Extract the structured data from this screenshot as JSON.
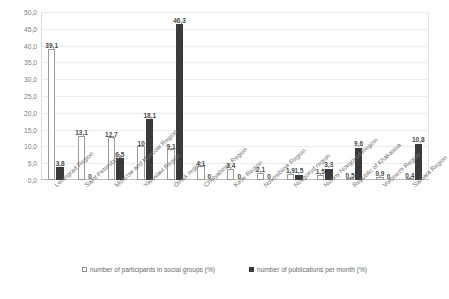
{
  "chart_data": {
    "type": "bar",
    "title": "",
    "subtitle": "",
    "xlabel": "",
    "ylabel": "",
    "ylim": [
      0,
      50
    ],
    "ytick_step": 5,
    "grid": true,
    "decimal_separator": ",",
    "legend_position": "bottom",
    "orientation": "vertical",
    "categories": [
      "Leningrad Region",
      "Saint Petersburg",
      "Moscow and Moscow Region",
      "Yaroslavl Region",
      "Omsk region",
      "Chelyabinsk Region",
      "Kirov Region",
      "Novosibirsk Region",
      "Novgorod region",
      "Nizhny Novgorod Region",
      "Republic of Khakassia",
      "Voronezh Region",
      "Samara Region"
    ],
    "ytick_labels": [
      "0,0",
      "5,0",
      "10,0",
      "15,0",
      "20,0",
      "25,0",
      "30,0",
      "35,0",
      "40,0",
      "45,0",
      "50,0"
    ],
    "series": [
      {
        "name": "number of participants  in social  groups (%)",
        "color": "#ffffff",
        "border_color": "#9a9a9a",
        "values": [
          39.1,
          13.1,
          12.7,
          10.0,
          9.1,
          4.1,
          3.4,
          2.1,
          1.9,
          1.5,
          0.5,
          0.9,
          0.4
        ],
        "labels": [
          "39,1",
          "13,1",
          "12,7",
          "10",
          "9,1",
          "4,1",
          "3,4",
          "2,1",
          "1,9",
          "1,5",
          "0,5",
          "0,9",
          "0,4"
        ]
      },
      {
        "name": "number of publications  per month (%)",
        "color": "#3a3a3a",
        "border_color": "#3a3a3a",
        "values": [
          3.8,
          0,
          6.5,
          18.1,
          46.3,
          0,
          0,
          0,
          1.5,
          3.3,
          9.6,
          0,
          10.8
        ],
        "labels": [
          "3,8",
          "0",
          "6,5",
          "18,1",
          "46,3",
          "0",
          "0",
          "0",
          "1,5",
          "3,3",
          "9,6",
          "0",
          "10,8"
        ]
      }
    ]
  }
}
